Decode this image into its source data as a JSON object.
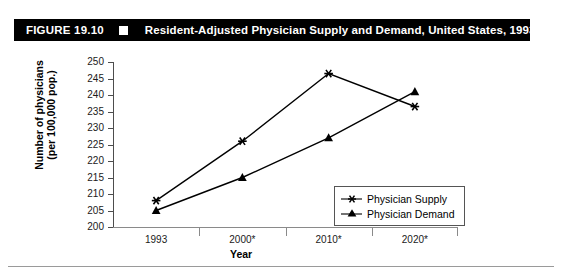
{
  "figure": {
    "number": "FIGURE 19.10",
    "square_icon": "black-square-bullet",
    "title": "Resident-Adjusted Physician Supply and Demand, United States, 1993–2020"
  },
  "chart_data": {
    "type": "line",
    "title": "Resident-Adjusted Physician Supply and Demand, United States, 1993–2020",
    "xlabel": "Year",
    "ylabel": "Number of physicians (per 100,000 pop.)",
    "ylabel_line1": "Number of physicians",
    "ylabel_line2": "(per 100,000 pop.)",
    "categories": [
      "1993",
      "2000*",
      "2010*",
      "2020*"
    ],
    "ylim": [
      200,
      250
    ],
    "ytick_step": 5,
    "yticks": [
      250,
      245,
      240,
      235,
      230,
      225,
      220,
      215,
      210,
      205,
      200
    ],
    "grid": false,
    "legend_position": "inside-lower-right",
    "series": [
      {
        "name": "Physician Supply",
        "marker": "asterisk",
        "color": "#000000",
        "values": [
          208,
          226,
          246.5,
          236.5
        ]
      },
      {
        "name": "Physician Demand",
        "marker": "triangle",
        "color": "#000000",
        "values": [
          205,
          215,
          227,
          241
        ]
      }
    ]
  }
}
